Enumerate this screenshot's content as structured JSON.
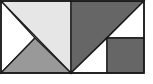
{
  "diagram": {
    "type": "tangram-rectangle",
    "outline": {
      "x": 1,
      "y": 1,
      "width": 143,
      "height": 72,
      "stroke": "#1a1a1a"
    },
    "colors": {
      "light": "#e6e6e6",
      "mid": "#999999",
      "dark": "#666666",
      "background": "#ffffff",
      "stroke": "#1a1a1a"
    },
    "pieces": [
      {
        "name": "light-triangle-top-left",
        "fill": "light",
        "points": "1,1 71,1 71,73"
      },
      {
        "name": "white-triangle-left",
        "fill": "background",
        "points": "1,1 35,38 1,73"
      },
      {
        "name": "mid-triangle-bottom-left",
        "fill": "mid",
        "points": "1,73 35,38 71,73"
      },
      {
        "name": "dark-triangle-top-right",
        "fill": "dark",
        "points": "71,1 144,1 71,73"
      },
      {
        "name": "white-triangle-right-upper",
        "fill": "background",
        "points": "144,1 144,38 107,38"
      },
      {
        "name": "white-triangle-bottom-middle",
        "fill": "background",
        "points": "71,73 107,38 107,73"
      },
      {
        "name": "dark-square-bottom-right",
        "fill": "dark",
        "points": "107,38 144,38 144,73 107,73"
      }
    ]
  }
}
